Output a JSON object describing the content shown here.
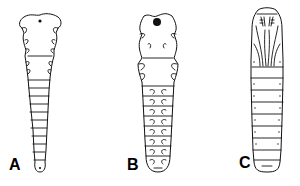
{
  "figure": {
    "panels": [
      {
        "id": "A",
        "label": "A"
      },
      {
        "id": "B",
        "label": "B"
      },
      {
        "id": "C",
        "label": "C"
      }
    ],
    "colors": {
      "background": "#ffffff",
      "ink": "#111111"
    }
  }
}
